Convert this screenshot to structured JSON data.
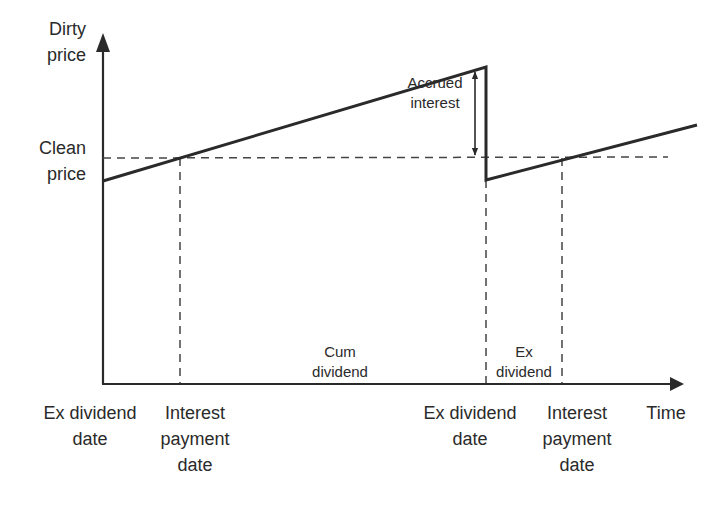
{
  "diagram": {
    "type": "bond dirty vs clean price over time",
    "y_axis_label_top": [
      "Dirty",
      "price"
    ],
    "y_axis_label_mid": [
      "Clean",
      "price"
    ],
    "x_axis_label": "Time",
    "annotation_accrued": [
      "Accrued",
      "interest"
    ],
    "region_cum": [
      "Cum",
      "dividend"
    ],
    "region_ex": [
      "Ex",
      "dividend"
    ],
    "x_labels": [
      {
        "lines": [
          "Ex dividend",
          "date"
        ]
      },
      {
        "lines": [
          "Interest",
          "payment",
          "date"
        ]
      },
      {
        "lines": [
          "Ex dividend",
          "date"
        ]
      },
      {
        "lines": [
          "Interest",
          "payment",
          "date"
        ]
      }
    ],
    "colors": {
      "line": "#2a2a2a",
      "dash": "#444444",
      "background": "#ffffff"
    }
  }
}
